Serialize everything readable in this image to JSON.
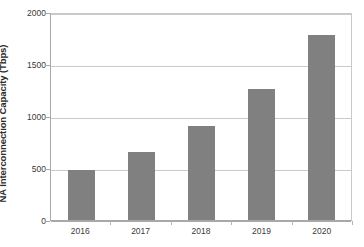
{
  "chart_data": {
    "type": "bar",
    "title": "",
    "xlabel": "",
    "ylabel": "NA Interconnection Capacity (Tbps)",
    "categories": [
      "2016",
      "2017",
      "2018",
      "2019",
      "2020"
    ],
    "values": [
      480,
      650,
      905,
      1260,
      1780
    ],
    "ylim": [
      0,
      2000
    ],
    "yticks": [
      0,
      500,
      1000,
      1500,
      2000
    ],
    "ytick_labels": [
      "0",
      "500",
      "1000",
      "1500",
      "2000"
    ],
    "grid": true,
    "legend": false,
    "series": [
      {
        "name": "NA Interconnection Capacity",
        "values": [
          480,
          650,
          905,
          1260,
          1780
        ]
      }
    ],
    "colors": {
      "bar": "#808080",
      "gridline": "#c9c9c9",
      "axis": "#a8a8a8",
      "text": "#3a3a3a",
      "plot_background": "#ffffff"
    }
  }
}
